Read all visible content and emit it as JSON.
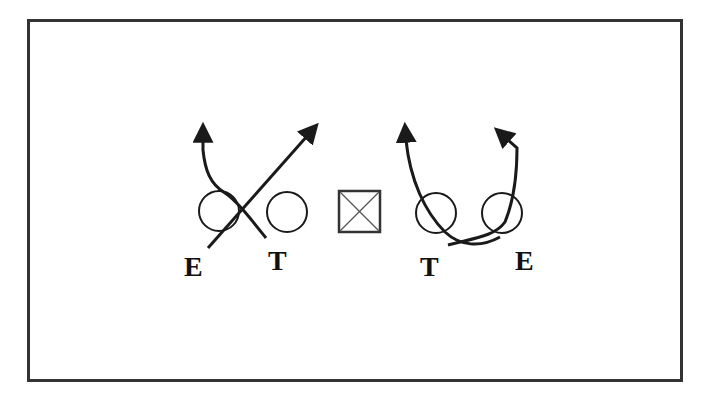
{
  "diagram": {
    "colors": {
      "stroke": "#1a1a1a",
      "frame": "#333333",
      "background": "#ffffff"
    },
    "center_marker": {
      "symbol": "boxed-X",
      "label": ""
    },
    "players": [
      {
        "id": "left-end",
        "label": "E",
        "side": "left"
      },
      {
        "id": "left-tackle",
        "label": "T",
        "side": "left"
      },
      {
        "id": "right-tackle",
        "label": "T",
        "side": "right"
      },
      {
        "id": "right-end",
        "label": "E",
        "side": "right"
      }
    ],
    "routes": [
      {
        "from": "left-end",
        "description": "crosses inside then loops up-left",
        "arrow": true
      },
      {
        "from": "left-tackle",
        "description": "diagonal up-right",
        "arrow": true
      },
      {
        "from": "right-tackle",
        "description": "curves up-left",
        "arrow": true
      },
      {
        "from": "right-end",
        "description": "loops under then up, hooking left",
        "arrow": true
      }
    ]
  }
}
